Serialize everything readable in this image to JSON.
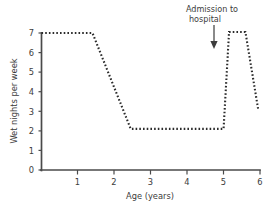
{
  "chart_data": {
    "type": "line",
    "title": "",
    "subtitle": "",
    "xlabel": "Age (years)",
    "ylabel": "Wet nights per week",
    "xlim": [
      0,
      6.2
    ],
    "ylim": [
      0,
      7.4
    ],
    "xticks": [
      1,
      2,
      3,
      4,
      5,
      6
    ],
    "xtick_labels": [
      "1",
      "2",
      "3",
      "4",
      "5",
      "6"
    ],
    "yticks": [
      0,
      1,
      2,
      3,
      4,
      5,
      6,
      7
    ],
    "ytick_labels": [
      "0",
      "1",
      "2",
      "3",
      "4",
      "5",
      "6",
      "7"
    ],
    "grid": false,
    "legend": null,
    "line_style": "dashed",
    "series": [
      {
        "name": "Wet nights per week",
        "x": [
          0.0,
          1.4,
          2.45,
          5.0,
          5.15,
          5.6,
          5.95
        ],
        "y": [
          7.0,
          7.0,
          2.1,
          2.1,
          7.05,
          7.05,
          3.1
        ]
      }
    ],
    "annotations": [
      {
        "text": "Admission to hospital",
        "lines": [
          "Admission to",
          "hospital"
        ],
        "x": 5.0,
        "y": 7.0,
        "marker": "down-arrow"
      }
    ]
  },
  "axis": {
    "y_title": "Wet nights per week",
    "x_title": "Age (years)",
    "y_labels": [
      "7",
      "6",
      "5",
      "4",
      "3",
      "2",
      "1",
      "0"
    ],
    "x_labels": [
      "1",
      "2",
      "3",
      "4",
      "5",
      "6"
    ]
  },
  "annotation": {
    "line1": "Admission to",
    "line2": "hospital"
  },
  "colors": {
    "axis": "#4a4a4a",
    "data_line": "#2b2b2b",
    "text": "#3c3c3c",
    "background": "#ffffff"
  }
}
